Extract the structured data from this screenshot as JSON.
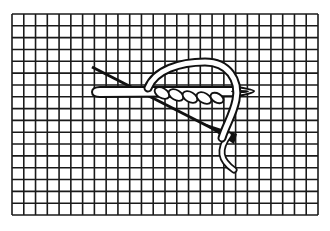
{
  "diagram": {
    "type": "stitch-illustration",
    "grid": {
      "x0": 12,
      "y0": 14,
      "x1": 318,
      "y1": 215,
      "columns": 26,
      "rows": 17,
      "line_color": "#1a1a1a",
      "background": "#ffffff"
    },
    "elements": [
      {
        "name": "needle",
        "description": "horizontal needle with eye on the right"
      },
      {
        "name": "thread-loop",
        "description": "white thread arching over and around the needle"
      },
      {
        "name": "twisted-wraps",
        "description": "thread wrapped around the needle shaft"
      },
      {
        "name": "diagonal-thread",
        "description": "dark diagonal thread crossing beneath"
      }
    ],
    "colors": {
      "ink": "#111111",
      "fill": "#ffffff"
    }
  }
}
